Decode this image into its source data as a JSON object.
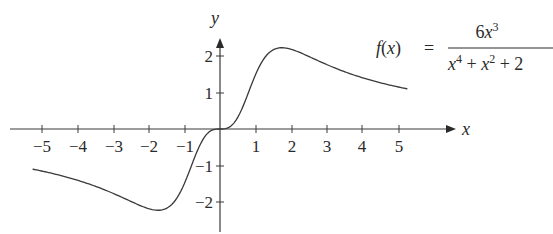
{
  "chart_data": {
    "type": "line",
    "title": "",
    "function_label": "f(x) = 6x^3 / (x^4 + x^2 + 2)",
    "formula": {
      "lhs": "f(x)",
      "equals": "=",
      "numerator": "6x^3",
      "denominator": "x^4 + x^2 + 2"
    },
    "xlabel": "x",
    "ylabel": "y",
    "xlim": [
      -5.3,
      5.3
    ],
    "ylim": [
      -2.5,
      2.5
    ],
    "grid": false,
    "x_ticks": [
      -5,
      -4,
      -3,
      -2,
      -1,
      1,
      2,
      3,
      4,
      5
    ],
    "y_ticks": [
      -2,
      -1,
      1,
      2
    ],
    "x_tick_labels": [
      "−5",
      "−4",
      "−3",
      "−2",
      "−1",
      "1",
      "2",
      "3",
      "4",
      "5"
    ],
    "y_tick_labels": [
      "−2",
      "−1",
      "1",
      "2"
    ],
    "series": [
      {
        "name": "f(x)",
        "x": [
          -5,
          -4,
          -3,
          -2,
          -1.7,
          -1.5,
          -1,
          -0.5,
          0,
          0.5,
          1,
          1.5,
          1.7,
          2,
          3,
          4,
          5
        ],
        "y": [
          -1.15,
          -1.4,
          -1.76,
          -2.18,
          -2.23,
          -2.21,
          -1.5,
          -0.32,
          0,
          0.32,
          1.5,
          2.21,
          2.23,
          2.18,
          1.76,
          1.4,
          1.15
        ]
      }
    ]
  },
  "axes": {
    "x_label": "x",
    "y_label": "y"
  },
  "colors": {
    "curve": "#3a3a3a",
    "axis": "#3a3a3a",
    "text": "#2a2a2a",
    "background": "#ffffff"
  }
}
